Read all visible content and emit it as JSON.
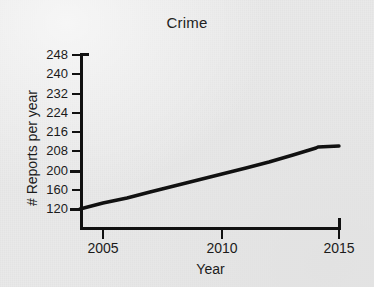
{
  "chart_data": {
    "type": "line",
    "title": "Crime",
    "xlabel": "Year",
    "ylabel": "# Reports per year",
    "grid": false,
    "legend": false,
    "legend_position": "none",
    "line_color": "#111111",
    "background_color": "#e9e9e9",
    "xlim": [
      2004,
      2015
    ],
    "xticks": [
      2005,
      2010,
      2015
    ],
    "xtick_labels": [
      "2005",
      "2010",
      "2015"
    ],
    "ytick_labels": [
      "248",
      "240",
      "232",
      "224",
      "216",
      "208",
      "200",
      "160",
      "120"
    ],
    "yticks": [
      248,
      240,
      232,
      224,
      216,
      208,
      200,
      160,
      120
    ],
    "ytick_note": "tick labels are evenly spaced on screen although the values step by 8 at the top and by 40 between 200, 160 and 120",
    "x": [
      2004,
      2005,
      2006,
      2007,
      2008,
      2009,
      2010,
      2011,
      2012,
      2013,
      2014,
      2015
    ],
    "values": [
      120,
      128,
      136,
      145,
      153,
      162,
      170,
      179,
      188,
      196,
      203,
      213
    ],
    "series": [
      {
        "name": "Crime",
        "values": [
          120,
          128,
          136,
          145,
          153,
          162,
          170,
          179,
          188,
          196,
          203,
          213
        ]
      }
    ],
    "annotations": [
      "steady near-linear rise from 2004 to about 2014",
      "sharp upturn between 2014 and 2015"
    ]
  },
  "axes": {
    "y_tick_rows": [
      {
        "label": "248",
        "top": 55,
        "major": false
      },
      {
        "label": "240",
        "top": 74.25,
        "major": false
      },
      {
        "label": "232",
        "top": 93.5,
        "major": false
      },
      {
        "label": "224",
        "top": 112.75,
        "major": false
      },
      {
        "label": "216",
        "top": 132,
        "major": false
      },
      {
        "label": "208",
        "top": 151.25,
        "major": false
      },
      {
        "label": "200",
        "top": 170.5,
        "major": true
      },
      {
        "label": "160",
        "top": 189.75,
        "major": false
      },
      {
        "label": "120",
        "top": 209,
        "major": true
      }
    ],
    "x_tick_cols": [
      {
        "label": "2005",
        "left": 103
      },
      {
        "label": "2010",
        "left": 222
      },
      {
        "label": "2015",
        "left": 339
      }
    ]
  },
  "series_path": "80,209 103,203 127,198 150,192 174,186 198,180 222,174 246,168 269,162 293,155 316,148 318,147 339,146",
  "series_path_note": "screen coordinates of the plotted polyline in the 374x287 image"
}
